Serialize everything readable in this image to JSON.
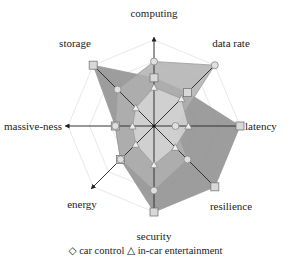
{
  "chart_data": {
    "type": "radar",
    "title": "",
    "axes": [
      "computing",
      "data rate",
      "latency",
      "resilience",
      "security",
      "energy",
      "massive-ness",
      "storage"
    ],
    "range": [
      0,
      1
    ],
    "grid": true,
    "grid_levels": 4,
    "series": [
      {
        "name": "series A (dark)",
        "marker": "square",
        "color": "#8c8c8c",
        "values": [
          0.56,
          0.55,
          1.0,
          1.0,
          1.0,
          0.55,
          0.45,
          1.0
        ]
      },
      {
        "name": "car control",
        "marker": "circle",
        "color": "#b0b0b0",
        "values": [
          0.75,
          1.0,
          0.25,
          0.55,
          0.75,
          0.55,
          0.45,
          0.6
        ]
      },
      {
        "name": "in-car entertainment",
        "marker": "triangle",
        "color": "#d6d6d6",
        "values": [
          0.45,
          0.45,
          0.4,
          0.35,
          0.45,
          0.3,
          0.25,
          0.3
        ]
      }
    ],
    "legend": {
      "position": "bottom",
      "entries": [
        "car control",
        "in-car entertainment"
      ]
    }
  },
  "legend": {
    "car_control_symbol": "◇",
    "car_control_label": "car control",
    "entertainment_symbol": "△",
    "entertainment_label": "in-car entertainment"
  }
}
